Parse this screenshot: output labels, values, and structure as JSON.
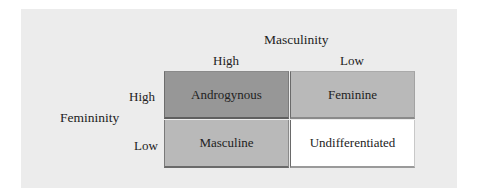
{
  "diagram": {
    "column_axis": {
      "title": "Masculinity",
      "levels": [
        "High",
        "Low"
      ]
    },
    "row_axis": {
      "title": "Femininity",
      "levels": [
        "High",
        "Low"
      ]
    },
    "cells": [
      {
        "femininity": "High",
        "masculinity": "High",
        "label": "Androgynous",
        "color": "#979797"
      },
      {
        "femininity": "High",
        "masculinity": "Low",
        "label": "Feminine",
        "color": "#b9b9b9"
      },
      {
        "femininity": "Low",
        "masculinity": "High",
        "label": "Masculine",
        "color": "#b9b9b9"
      },
      {
        "femininity": "Low",
        "masculinity": "Low",
        "label": "Undifferentiated",
        "color": "#ffffff"
      }
    ],
    "colors": {
      "panel_background": "#ececec",
      "text": "#222222",
      "border": "#6a6a6a"
    }
  }
}
